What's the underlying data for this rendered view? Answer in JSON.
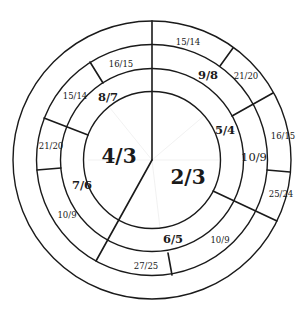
{
  "diagram": {
    "center": {
      "x": 152,
      "y": 160
    },
    "radii": {
      "core": 68.5,
      "inner_band": 91.5,
      "middle_band": 115.5,
      "outer_band": 139
    },
    "core": [
      {
        "label": "4/3",
        "x": 119,
        "y": 157
      },
      {
        "label": "2/3",
        "x": 188,
        "y": 178
      }
    ],
    "inner_band": [
      {
        "label": "8/7",
        "x": 108,
        "y": 98
      },
      {
        "label": "5/4",
        "x": 225,
        "y": 131
      },
      {
        "label": "7/6",
        "x": 82,
        "y": 186
      },
      {
        "label": "6/5",
        "x": 173,
        "y": 240
      }
    ],
    "middle_band": [
      {
        "label": "16/15",
        "x": 121,
        "y": 64
      },
      {
        "label": "9/8",
        "x": 208,
        "y": 76
      },
      {
        "label": "15/14",
        "x": 75,
        "y": 96
      },
      {
        "label": "21/20",
        "x": 51,
        "y": 146
      },
      {
        "label": "10/9",
        "x": 254,
        "y": 158
      },
      {
        "label": "10/9",
        "x": 67,
        "y": 215
      },
      {
        "label": "10/9",
        "x": 220,
        "y": 240
      },
      {
        "label": "27/25",
        "x": 146,
        "y": 266
      }
    ],
    "outer_band": [
      {
        "label": "15/14",
        "x": 188,
        "y": 42
      },
      {
        "label": "21/20",
        "x": 246,
        "y": 76
      },
      {
        "label": "16/15",
        "x": 283,
        "y": 136
      },
      {
        "label": "25/24",
        "x": 281,
        "y": 194
      }
    ]
  }
}
